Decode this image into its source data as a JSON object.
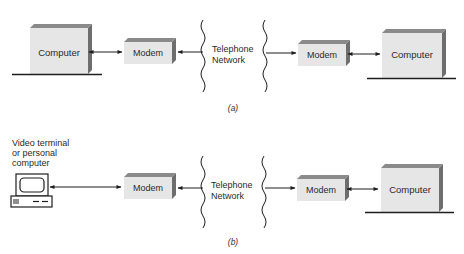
{
  "colors": {
    "box_face": "#e6e6e6",
    "box_top": "#8a8a8a",
    "box_side": "#6e6e6e",
    "line": "#1e1e1e"
  },
  "diagram_a": {
    "caption": "(a)",
    "left_computer": "Computer",
    "left_modem": "Modem",
    "network_line1": "Telephone",
    "network_line2": "Network",
    "right_modem": "Modem",
    "right_computer": "Computer"
  },
  "diagram_b": {
    "caption": "(b)",
    "terminal_label_line1": "Video terminal",
    "terminal_label_line2": "or personal",
    "terminal_label_line3": "computer",
    "terminal_icon": "video-terminal-icon",
    "left_modem": "Modem",
    "network_line1": "Telephone",
    "network_line2": "Network",
    "right_modem": "Modem",
    "right_computer": "Computer"
  }
}
